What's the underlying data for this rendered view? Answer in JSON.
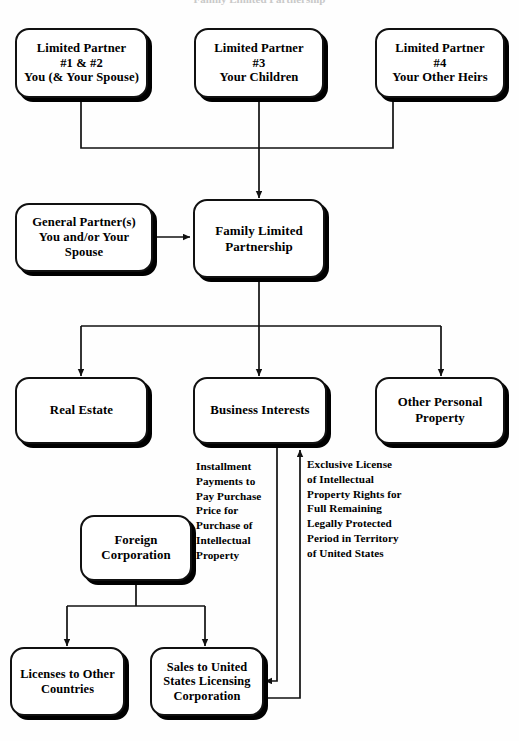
{
  "diagram": {
    "title_partial": "Family Limited Partnership",
    "nodes": {
      "lp1": "Limited Partner\n#1 & #2\nYou (& Your Spouse)",
      "lp3": "Limited Partner\n#3\nYour Children",
      "lp4": "Limited Partner\n#4\nYour Other Heirs",
      "general_partner": "General Partner(s)\nYou and/or Your\nSpouse",
      "flp": "Family Limited\nPartnership",
      "real_estate": "Real Estate",
      "business_interests": "Business Interests",
      "other_personal_property": "Other Personal\nProperty",
      "foreign_corporation": "Foreign\nCorporation",
      "licenses_other_countries": "Licenses to Other\nCountries",
      "sales_us_licensing": "Sales to United\nStates Licensing\nCorporation"
    },
    "annotations": {
      "installment": "Installment\nPayments to\nPay Purchase\nPrice for\nPurchase of\nIntellectual\nProperty",
      "exclusive_license": "Exclusive License\nof Intellectual\nProperty Rights for\nFull Remaining\nLegally Protected\nPeriod in Territory\nof United States"
    },
    "colors": {
      "stroke": "#111111",
      "fill": "#ffffff",
      "text": "#000000"
    }
  }
}
